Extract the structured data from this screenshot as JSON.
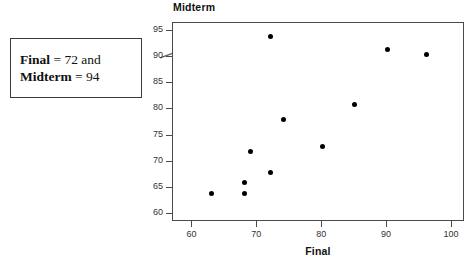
{
  "figure": {
    "callout": {
      "line1_label": "Final",
      "line1_rest": " = 72 and",
      "line2_label": "Midterm",
      "line2_rest": " = 94"
    },
    "top_artifact": "_ _ _ _ _ _"
  },
  "chart_data": {
    "type": "scatter",
    "title": "",
    "xlabel": "Final",
    "ylabel": "Midterm",
    "xlim": [
      57,
      102
    ],
    "ylim": [
      58.5,
      96.5
    ],
    "xticks": [
      60,
      70,
      80,
      90,
      100
    ],
    "yticks": [
      60,
      65,
      70,
      75,
      80,
      85,
      90,
      95
    ],
    "grid": false,
    "legend": false,
    "points": [
      {
        "x": 63,
        "y": 64
      },
      {
        "x": 68,
        "y": 64
      },
      {
        "x": 68,
        "y": 66
      },
      {
        "x": 69,
        "y": 72
      },
      {
        "x": 72,
        "y": 68
      },
      {
        "x": 72,
        "y": 94
      },
      {
        "x": 74,
        "y": 78
      },
      {
        "x": 80,
        "y": 73
      },
      {
        "x": 85,
        "y": 81
      },
      {
        "x": 90,
        "y": 91.5
      },
      {
        "x": 96,
        "y": 90.5
      }
    ],
    "annotations": [
      {
        "text": "Final = 72 and Midterm = 94",
        "points_to": {
          "x": 72,
          "y": 94
        }
      }
    ]
  }
}
